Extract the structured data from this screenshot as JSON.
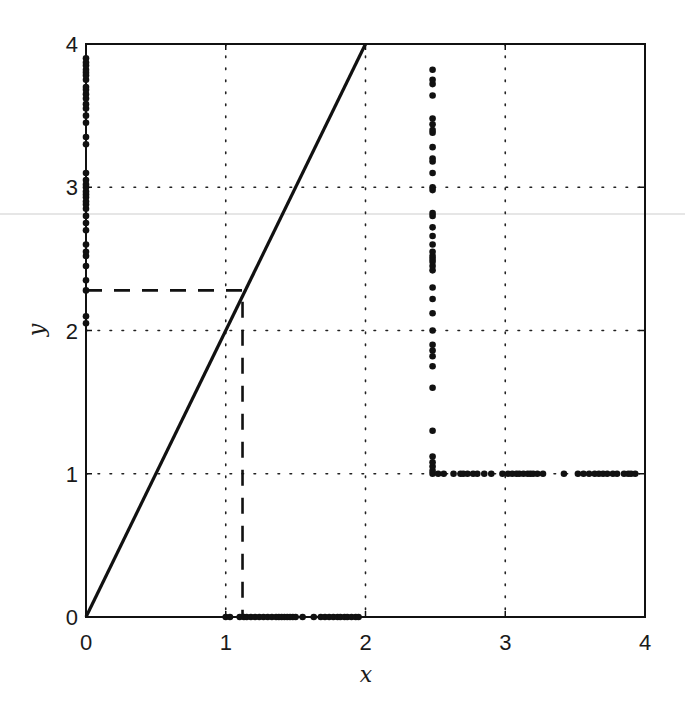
{
  "chart_data": {
    "type": "line",
    "title": "",
    "xlabel": "x",
    "ylabel": "y",
    "xlim": [
      0,
      4
    ],
    "ylim": [
      0,
      4
    ],
    "xticks": [
      "0",
      "1",
      "2",
      "3",
      "4"
    ],
    "yticks": [
      "0",
      "1",
      "2",
      "3",
      "4"
    ],
    "grid": "dotted",
    "legend": null,
    "series": [
      {
        "name": "solid-line",
        "style": "solid",
        "color": "#111111",
        "x": [
          0,
          2
        ],
        "y": [
          0,
          4
        ]
      },
      {
        "name": "dashed-projection",
        "style": "dashed",
        "color": "#111111",
        "x": [
          0,
          1.12,
          1.12
        ],
        "y": [
          2.28,
          2.28,
          0
        ]
      },
      {
        "name": "dots-left-axis",
        "style": "markers",
        "color": "#111111",
        "x": [
          0,
          0,
          0,
          0,
          0,
          0,
          0,
          0,
          0,
          0,
          0,
          0,
          0,
          0,
          0,
          0,
          0,
          0,
          0,
          0,
          0,
          0,
          0,
          0,
          0,
          0,
          0,
          0,
          0,
          0,
          0,
          0,
          0,
          0,
          0,
          0,
          0,
          0
        ],
        "y": [
          2.05,
          2.1,
          2.28,
          2.35,
          2.45,
          2.52,
          2.55,
          2.6,
          2.7,
          2.75,
          2.8,
          2.85,
          2.88,
          2.9,
          2.93,
          2.95,
          2.97,
          3.0,
          3.02,
          3.05,
          3.1,
          3.3,
          3.35,
          3.45,
          3.5,
          3.55,
          3.58,
          3.62,
          3.65,
          3.68,
          3.7,
          3.75,
          3.78,
          3.8,
          3.82,
          3.85,
          3.87,
          3.9
        ]
      },
      {
        "name": "dots-x-axis",
        "style": "markers",
        "color": "#111111",
        "x": [
          1.0,
          1.03,
          1.1,
          1.13,
          1.15,
          1.18,
          1.21,
          1.24,
          1.27,
          1.3,
          1.33,
          1.36,
          1.38,
          1.4,
          1.42,
          1.44,
          1.46,
          1.48,
          1.5,
          1.55,
          1.63,
          1.68,
          1.71,
          1.74,
          1.77,
          1.8,
          1.82,
          1.85,
          1.87,
          1.9,
          1.93,
          1.95
        ],
        "y": [
          0,
          0,
          0,
          0,
          0,
          0,
          0,
          0,
          0,
          0,
          0,
          0,
          0,
          0,
          0,
          0,
          0,
          0,
          0,
          0,
          0,
          0,
          0,
          0,
          0,
          0,
          0,
          0,
          0,
          0,
          0,
          0
        ]
      },
      {
        "name": "dots-vertical-x2.5",
        "style": "markers",
        "color": "#111111",
        "x": [
          2.48,
          2.48,
          2.48,
          2.48,
          2.48,
          2.48,
          2.48,
          2.48,
          2.48,
          2.48,
          2.48,
          2.48,
          2.48,
          2.48,
          2.48,
          2.48,
          2.48,
          2.48,
          2.48,
          2.48,
          2.48,
          2.48,
          2.48,
          2.48,
          2.48,
          2.48,
          2.48,
          2.48,
          2.48,
          2.48,
          2.48,
          2.48,
          2.48,
          2.48,
          2.48,
          2.48,
          2.48,
          2.48,
          2.48,
          2.48
        ],
        "y": [
          1.0,
          1.02,
          1.05,
          1.08,
          1.12,
          1.3,
          1.6,
          1.75,
          1.82,
          1.86,
          1.9,
          2.0,
          2.12,
          2.22,
          2.3,
          2.42,
          2.45,
          2.48,
          2.5,
          2.52,
          2.55,
          2.6,
          2.66,
          2.72,
          2.8,
          2.82,
          2.98,
          3.0,
          3.1,
          3.18,
          3.2,
          3.28,
          3.38,
          3.4,
          3.44,
          3.48,
          3.64,
          3.72,
          3.75,
          3.82
        ]
      },
      {
        "name": "dots-horizontal-y1",
        "style": "markers",
        "color": "#111111",
        "x": [
          2.52,
          2.56,
          2.63,
          2.68,
          2.7,
          2.73,
          2.77,
          2.8,
          2.85,
          2.9,
          2.98,
          3.02,
          3.05,
          3.08,
          3.1,
          3.13,
          3.16,
          3.18,
          3.2,
          3.23,
          3.27,
          3.42,
          3.52,
          3.56,
          3.6,
          3.64,
          3.67,
          3.7,
          3.73,
          3.77,
          3.8,
          3.85,
          3.88,
          3.9,
          3.93
        ],
        "y": [
          1,
          1,
          1,
          1,
          1,
          1,
          1,
          1,
          1,
          1,
          1,
          1,
          1,
          1,
          1,
          1,
          1,
          1,
          1,
          1,
          1,
          1,
          1,
          1,
          1,
          1,
          1,
          1,
          1,
          1,
          1,
          1,
          1,
          1,
          1
        ]
      }
    ]
  },
  "axes": {
    "x_label": "x",
    "y_label": "y",
    "x_ticks": [
      "0",
      "1",
      "2",
      "3",
      "4"
    ],
    "y_ticks": [
      "0",
      "1",
      "2",
      "3",
      "4"
    ]
  }
}
